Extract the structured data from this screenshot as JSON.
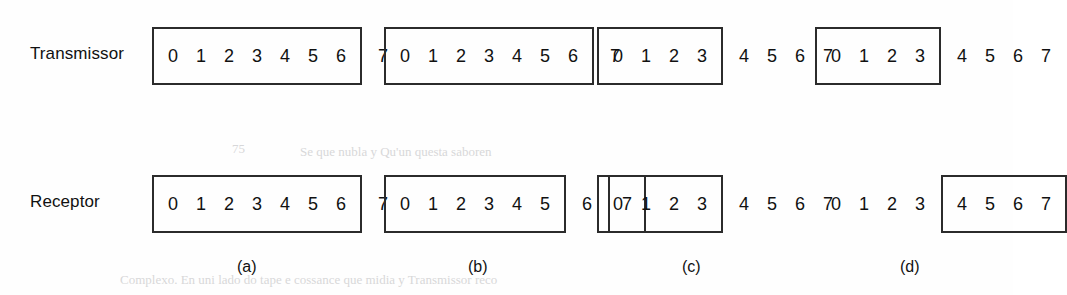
{
  "figure": {
    "rows": [
      {
        "id": "transmissor",
        "label": "Transmissor"
      },
      {
        "id": "receptor",
        "label": "Receptor"
      }
    ],
    "captions": [
      "(a)",
      "(b)",
      "(c)",
      "(d)"
    ],
    "ghost_text": [
      "75",
      "Se que nubla y Qu'un questa saboren",
      "Complexo. En uni lado do tape e cossance que midia y Transmissor reco"
    ]
  },
  "chart_data": {
    "type": "diagram",
    "title": "",
    "scenarios": [
      {
        "caption": "(a)",
        "transmissor": [
          {
            "digits": [
              "0",
              "1",
              "2",
              "3",
              "4",
              "5",
              "6"
            ],
            "boxed": true
          },
          {
            "digits": [
              "7"
            ],
            "boxed": false
          }
        ],
        "receptor": [
          {
            "digits": [
              "0",
              "1",
              "2",
              "3",
              "4",
              "5",
              "6"
            ],
            "boxed": true
          },
          {
            "digits": [
              "7"
            ],
            "boxed": false
          }
        ]
      },
      {
        "caption": "(b)",
        "transmissor": [
          {
            "digits": [
              "0",
              "1",
              "2",
              "3",
              "4",
              "5",
              "6"
            ],
            "boxed": true
          },
          {
            "digits": [
              "7"
            ],
            "boxed": false
          }
        ],
        "receptor": [
          {
            "digits": [
              "0",
              "1",
              "2",
              "3",
              "4",
              "5"
            ],
            "boxed": true
          },
          {
            "digits": [
              "6"
            ],
            "boxed": false
          },
          {
            "digits": [
              "7"
            ],
            "boxed": true
          }
        ]
      },
      {
        "caption": "(c)",
        "transmissor": [
          {
            "digits": [
              "0",
              "1",
              "2",
              "3"
            ],
            "boxed": true
          },
          {
            "digits": [
              "4",
              "5",
              "6",
              "7"
            ],
            "boxed": false
          }
        ],
        "receptor": [
          {
            "digits": [
              "0",
              "1",
              "2",
              "3"
            ],
            "boxed": true
          },
          {
            "digits": [
              "4",
              "5",
              "6",
              "7"
            ],
            "boxed": false
          }
        ]
      },
      {
        "caption": "(d)",
        "transmissor": [
          {
            "digits": [
              "0",
              "1",
              "2",
              "3"
            ],
            "boxed": true
          },
          {
            "digits": [
              "4",
              "5",
              "6",
              "7"
            ],
            "boxed": false
          }
        ],
        "receptor": [
          {
            "digits": [
              "0",
              "1",
              "2",
              "3"
            ],
            "boxed": false
          },
          {
            "digits": [
              "4",
              "5",
              "6",
              "7"
            ],
            "boxed": true
          }
        ]
      }
    ]
  },
  "layout": {
    "row_y": {
      "transmissor": 27,
      "receptor": 175
    },
    "label_y": {
      "transmissor": 44,
      "receptor": 192
    },
    "label_x": 30,
    "group_x": [
      152,
      384,
      597,
      815
    ],
    "caption_y": 258,
    "caption_x": [
      237,
      468,
      682,
      900
    ]
  }
}
